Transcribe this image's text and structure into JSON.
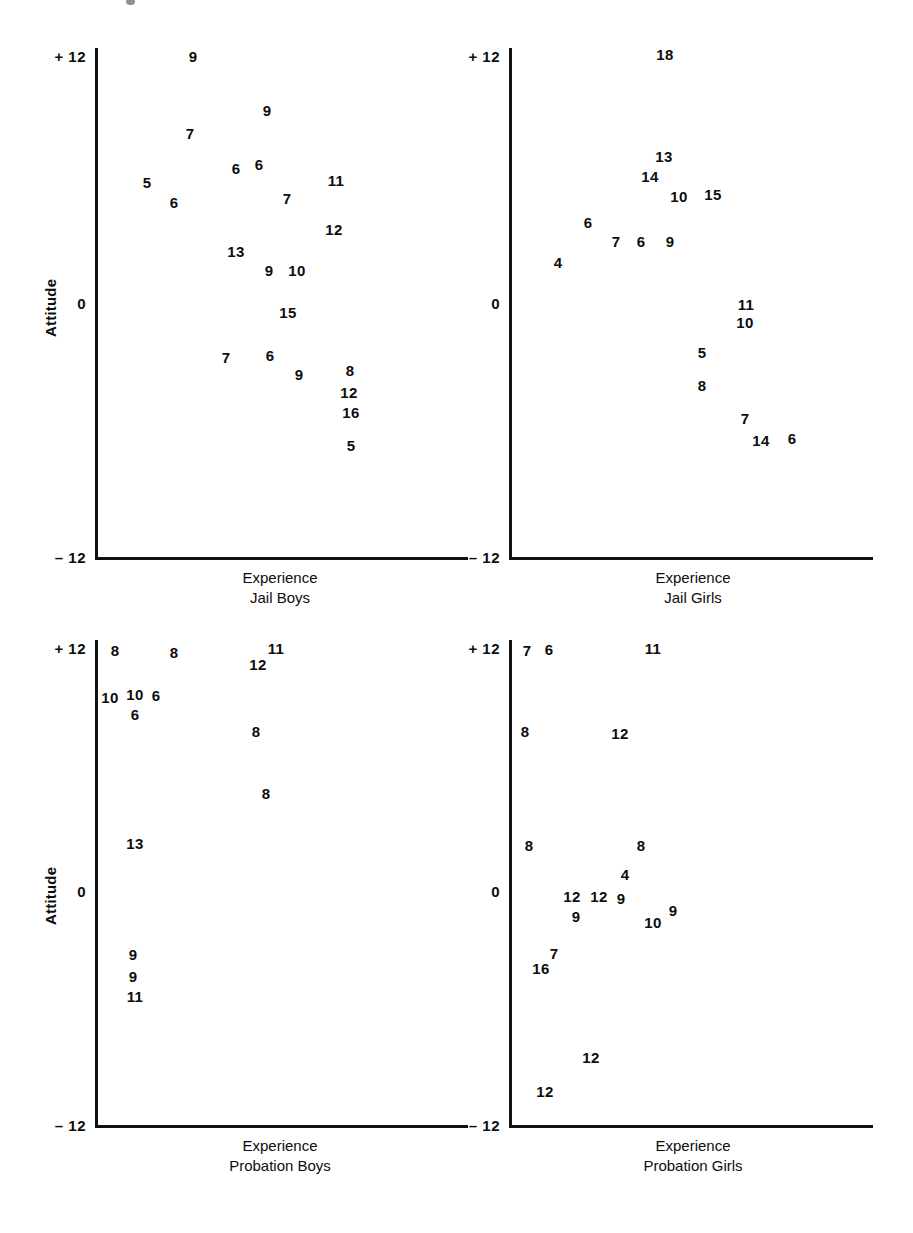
{
  "figure": {
    "axis_title_y": "Attitude",
    "axis_title_x": "Experience",
    "y_ticks": [
      "+ 12",
      "0",
      "– 12"
    ],
    "y_tick_values": [
      12,
      0,
      -12
    ],
    "ink_color": "#111111",
    "background_color": "#ffffff"
  },
  "panels": [
    {
      "id": "jail-boys",
      "group": "Jail Boys",
      "axis_title_x": "Experience",
      "axis_title_y": "Attitude",
      "y_ticks": [
        "+ 12",
        "0",
        "– 12"
      ]
    },
    {
      "id": "jail-girls",
      "group": "Jail Girls",
      "axis_title_x": "Experience",
      "axis_title_y": "",
      "y_ticks": [
        "+ 12",
        "0",
        "– 12"
      ]
    },
    {
      "id": "probation-boys",
      "group": "Probation Boys",
      "axis_title_x": "Experience",
      "axis_title_y": "Attitude",
      "y_ticks": [
        "+ 12",
        "0",
        "– 12"
      ]
    },
    {
      "id": "probation-girls",
      "group": "Probation Girls",
      "axis_title_x": "Experience",
      "axis_title_y": "",
      "y_ticks": [
        "+ 12",
        "0",
        "– 12"
      ]
    }
  ],
  "chart_data": [
    {
      "type": "scatter",
      "title": "Jail Boys",
      "xlabel": "Experience",
      "ylabel": "Attitude",
      "ylim": [
        -12,
        12
      ],
      "ytick_labels": [
        "+ 12",
        "0",
        "– 12"
      ],
      "ytick_values": [
        12,
        0,
        -12
      ],
      "grid": false,
      "legend": "none",
      "note": "Each plotted marker is the numeral of the case's score; x position encodes Experience (unlabelled axis), y position encodes Attitude.",
      "points": [
        {
          "label": "9",
          "px": 193,
          "py": 56,
          "attitude": 11.6
        },
        {
          "label": "9",
          "px": 267,
          "py": 110,
          "attitude": 9.1
        },
        {
          "label": "7",
          "px": 190,
          "py": 133,
          "attitude": 8.0
        },
        {
          "label": "6",
          "px": 236,
          "py": 168,
          "attitude": 6.4
        },
        {
          "label": "6",
          "px": 259,
          "py": 164,
          "attitude": 6.6
        },
        {
          "label": "5",
          "px": 147,
          "py": 182,
          "attitude": 5.7
        },
        {
          "label": "11",
          "px": 336,
          "py": 180,
          "attitude": 5.8
        },
        {
          "label": "6",
          "px": 174,
          "py": 202,
          "attitude": 4.8
        },
        {
          "label": "7",
          "px": 287,
          "py": 198,
          "attitude": 5.0
        },
        {
          "label": "12",
          "px": 334,
          "py": 229,
          "attitude": 3.5
        },
        {
          "label": "13",
          "px": 236,
          "py": 251,
          "attitude": 2.4
        },
        {
          "label": "9",
          "px": 269,
          "py": 270,
          "attitude": 1.5
        },
        {
          "label": "10",
          "px": 297,
          "py": 270,
          "attitude": 1.5
        },
        {
          "label": "15",
          "px": 288,
          "py": 312,
          "attitude": -0.5
        },
        {
          "label": "7",
          "px": 226,
          "py": 357,
          "attitude": -2.6
        },
        {
          "label": "6",
          "px": 270,
          "py": 355,
          "attitude": -2.5
        },
        {
          "label": "9",
          "px": 299,
          "py": 374,
          "attitude": -3.4
        },
        {
          "label": "8",
          "px": 350,
          "py": 370,
          "attitude": -3.2
        },
        {
          "label": "12",
          "px": 349,
          "py": 392,
          "attitude": -4.3
        },
        {
          "label": "16",
          "px": 351,
          "py": 412,
          "attitude": -5.2
        },
        {
          "label": "5",
          "px": 351,
          "py": 445,
          "attitude": -6.8
        }
      ]
    },
    {
      "type": "scatter",
      "title": "Jail Girls",
      "xlabel": "Experience",
      "ylabel": "Attitude",
      "ylim": [
        -12,
        12
      ],
      "ytick_labels": [
        "+ 12",
        "0",
        "– 12"
      ],
      "ytick_values": [
        12,
        0,
        -12
      ],
      "grid": false,
      "legend": "none",
      "points": [
        {
          "label": "18",
          "px": 665,
          "py": 54,
          "attitude": 11.8
        },
        {
          "label": "13",
          "px": 664,
          "py": 156,
          "attitude": 6.9
        },
        {
          "label": "14",
          "px": 650,
          "py": 176,
          "attitude": 6.0
        },
        {
          "label": "10",
          "px": 679,
          "py": 196,
          "attitude": 5.0
        },
        {
          "label": "15",
          "px": 713,
          "py": 194,
          "attitude": 5.1
        },
        {
          "label": "6",
          "px": 588,
          "py": 222,
          "attitude": 3.8
        },
        {
          "label": "7",
          "px": 616,
          "py": 241,
          "attitude": 2.9
        },
        {
          "label": "6",
          "px": 641,
          "py": 241,
          "attitude": 2.9
        },
        {
          "label": "9",
          "px": 670,
          "py": 241,
          "attitude": 2.9
        },
        {
          "label": "4",
          "px": 558,
          "py": 262,
          "attitude": 1.9
        },
        {
          "label": "11",
          "px": 746,
          "py": 304,
          "attitude": -0.1
        },
        {
          "label": "10",
          "px": 745,
          "py": 322,
          "attitude": -1.0
        },
        {
          "label": "5",
          "px": 702,
          "py": 352,
          "attitude": -2.4
        },
        {
          "label": "8",
          "px": 702,
          "py": 385,
          "attitude": -4.0
        },
        {
          "label": "7",
          "px": 745,
          "py": 418,
          "attitude": -5.6
        },
        {
          "label": "14",
          "px": 761,
          "py": 440,
          "attitude": -6.6
        },
        {
          "label": "6",
          "px": 792,
          "py": 438,
          "attitude": -6.5
        }
      ]
    },
    {
      "type": "scatter",
      "title": "Probation Boys",
      "xlabel": "Experience",
      "ylabel": "Attitude",
      "ylim": [
        -12,
        12
      ],
      "ytick_labels": [
        "+ 12",
        "0",
        "– 12"
      ],
      "ytick_values": [
        12,
        0,
        -12
      ],
      "grid": false,
      "legend": "none",
      "points": [
        {
          "label": "8",
          "px": 115,
          "py": 650,
          "attitude": 11.8
        },
        {
          "label": "8",
          "px": 174,
          "py": 652,
          "attitude": 11.7
        },
        {
          "label": "11",
          "px": 276,
          "py": 648,
          "attitude": 11.9
        },
        {
          "label": "12",
          "px": 258,
          "py": 664,
          "attitude": 11.1
        },
        {
          "label": "10",
          "px": 110,
          "py": 697,
          "attitude": 9.5
        },
        {
          "label": "10",
          "px": 135,
          "py": 694,
          "attitude": 9.6
        },
        {
          "label": "6",
          "px": 156,
          "py": 695,
          "attitude": 9.6
        },
        {
          "label": "6",
          "px": 135,
          "py": 714,
          "attitude": 8.7
        },
        {
          "label": "8",
          "px": 256,
          "py": 731,
          "attitude": 7.8
        },
        {
          "label": "8",
          "px": 266,
          "py": 793,
          "attitude": 4.8
        },
        {
          "label": "13",
          "px": 135,
          "py": 843,
          "attitude": 2.3
        },
        {
          "label": "9",
          "px": 133,
          "py": 954,
          "attitude": -3.1
        },
        {
          "label": "9",
          "px": 133,
          "py": 976,
          "attitude": -4.2
        },
        {
          "label": "11",
          "px": 135,
          "py": 996,
          "attitude": -5.2
        }
      ]
    },
    {
      "type": "scatter",
      "title": "Probation Girls",
      "xlabel": "Experience",
      "ylabel": "Attitude",
      "ylim": [
        -12,
        12
      ],
      "ytick_labels": [
        "+ 12",
        "0",
        "– 12"
      ],
      "ytick_values": [
        12,
        0,
        -12
      ],
      "grid": false,
      "legend": "none",
      "points": [
        {
          "label": "7",
          "px": 527,
          "py": 650,
          "attitude": 11.7
        },
        {
          "label": "6",
          "px": 549,
          "py": 649,
          "attitude": 11.8
        },
        {
          "label": "11",
          "px": 653,
          "py": 648,
          "attitude": 11.9
        },
        {
          "label": "8",
          "px": 525,
          "py": 731,
          "attitude": 7.8
        },
        {
          "label": "12",
          "px": 620,
          "py": 733,
          "attitude": 7.7
        },
        {
          "label": "8",
          "px": 529,
          "py": 845,
          "attitude": 2.2
        },
        {
          "label": "8",
          "px": 641,
          "py": 845,
          "attitude": 2.2
        },
        {
          "label": "4",
          "px": 625,
          "py": 874,
          "attitude": 0.8
        },
        {
          "label": "12",
          "px": 572,
          "py": 896,
          "attitude": -0.3
        },
        {
          "label": "12",
          "px": 599,
          "py": 896,
          "attitude": -0.3
        },
        {
          "label": "9",
          "px": 621,
          "py": 898,
          "attitude": -0.4
        },
        {
          "label": "9",
          "px": 576,
          "py": 916,
          "attitude": -1.3
        },
        {
          "label": "9",
          "px": 673,
          "py": 910,
          "attitude": -1.0
        },
        {
          "label": "10",
          "px": 653,
          "py": 922,
          "attitude": -1.6
        },
        {
          "label": "7",
          "px": 554,
          "py": 953,
          "attitude": -3.1
        },
        {
          "label": "16",
          "px": 541,
          "py": 968,
          "attitude": -3.8
        },
        {
          "label": "12",
          "px": 591,
          "py": 1057,
          "attitude": -8.2
        },
        {
          "label": "12",
          "px": 545,
          "py": 1091,
          "attitude": -9.9
        }
      ]
    }
  ]
}
